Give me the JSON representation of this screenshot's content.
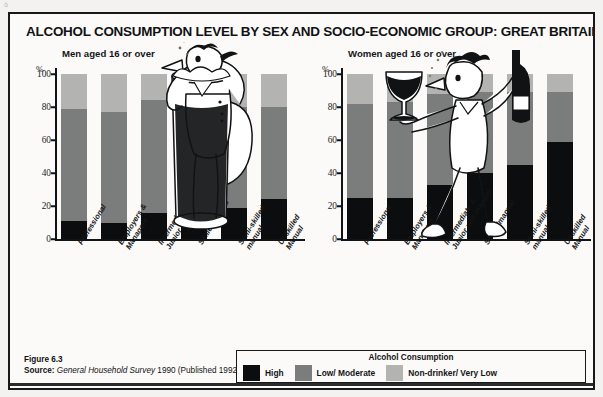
{
  "title": "ALCOHOL CONSUMPTION LEVEL BY SEX AND SOCIO-ECONOMIC GROUP: GREAT BRITAIN, 1990",
  "panels": {
    "men_caption": "Men aged 16 or over",
    "women_caption": "Women aged 16 or over",
    "axis_unit": "%"
  },
  "footer": {
    "figure": "Figure 6.3",
    "source_label": "Source:",
    "source_italic": "General Household Survey",
    "source_rest": "1990 (Published 1992)."
  },
  "legend": {
    "title": "Alcohol Consumption",
    "items": [
      {
        "label": "High",
        "color": "#0c0d0e"
      },
      {
        "label": "Low/ Moderate",
        "color": "#7b7c7c"
      },
      {
        "label": "Non-drinker/ Very Low",
        "color": "#b3b4b2"
      }
    ]
  },
  "colors": {
    "high": "#0c0d0e",
    "low_moderate": "#7b7c7c",
    "non_drinker": "#b3b4b2",
    "ink": "#121315",
    "page": "#fbfaf8"
  },
  "chart_data": [
    {
      "type": "bar",
      "title": "Men aged 16 or over",
      "stacked": true,
      "xlabel": "",
      "ylabel": "%",
      "ylim": [
        0,
        100
      ],
      "yticks": [
        0,
        20,
        40,
        60,
        80,
        100
      ],
      "grid": false,
      "legend_position": "bottom",
      "categories": [
        "Professional",
        "Employers &\nManagers",
        "Intermediate &\nJunior non-manual",
        "Skilledmanual",
        "Semi-skilled\nmanual",
        "Unskilled\nManual"
      ],
      "series": [
        {
          "name": "High",
          "values": [
            11,
            10,
            16,
            18,
            19,
            24
          ]
        },
        {
          "name": "Low/ Moderate",
          "values": [
            68,
            67,
            68,
            62,
            61,
            56
          ]
        },
        {
          "name": "Non-drinker/ Very Low",
          "values": [
            21,
            23,
            16,
            20,
            20,
            20
          ]
        }
      ],
      "cumulative_tops": {
        "high": [
          11,
          10,
          16,
          18,
          19,
          24
        ],
        "low_moderate": [
          79,
          77,
          84,
          80,
          80,
          80
        ],
        "total": [
          100,
          100,
          100,
          100,
          100,
          100
        ]
      }
    },
    {
      "type": "bar",
      "title": "Women aged 16 or over",
      "stacked": true,
      "xlabel": "",
      "ylabel": "%",
      "ylim": [
        0,
        100
      ],
      "yticks": [
        0,
        20,
        40,
        60,
        80,
        100
      ],
      "grid": false,
      "legend_position": "bottom",
      "categories": [
        "Professional",
        "Employers &\nManagers",
        "Intermediate &\nJunior non-manual",
        "Skilledmanual",
        "Semi-skilled\nmanual",
        "Unskilled\nManual"
      ],
      "series": [
        {
          "name": "High",
          "values": [
            25,
            25,
            33,
            40,
            45,
            59
          ]
        },
        {
          "name": "Low/ Moderate",
          "values": [
            57,
            58,
            55,
            49,
            44,
            30
          ]
        },
        {
          "name": "Non-drinker/ Very Low",
          "values": [
            18,
            17,
            12,
            11,
            11,
            11
          ]
        }
      ],
      "cumulative_tops": {
        "high": [
          25,
          25,
          33,
          40,
          45,
          59
        ],
        "low_moderate": [
          82,
          83,
          88,
          89,
          89,
          89
        ],
        "total": [
          100,
          100,
          100,
          100,
          100,
          100
        ]
      }
    }
  ],
  "artifact": "ó"
}
